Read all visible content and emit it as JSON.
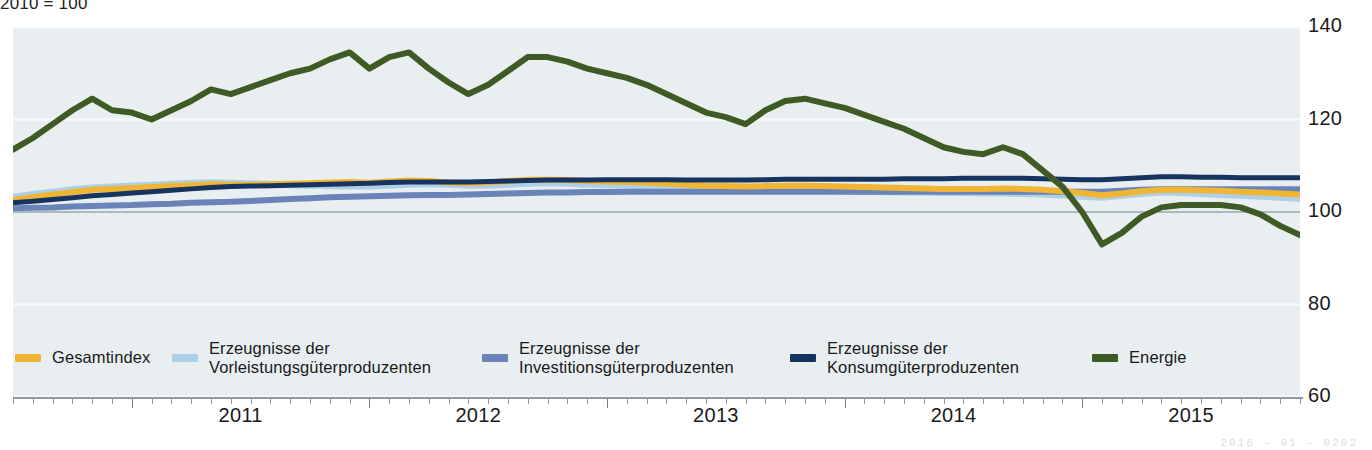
{
  "subtitle": "2010 = 100",
  "footnote": "2016 - 01 - 0202",
  "axes": {
    "y_ticks": [
      140,
      120,
      100,
      80,
      60
    ],
    "ylim": [
      60,
      140
    ],
    "x_year_labels": [
      "2011",
      "2012",
      "2013",
      "2014",
      "2015"
    ],
    "xlim_start": "2010-07",
    "xlim_end": "2015-12"
  },
  "colors": {
    "gesamtindex": "#f0b633",
    "vorleistung": "#aecfe8",
    "investition": "#6a83b8",
    "konsum": "#17335f",
    "energie": "#3f5a24",
    "plot_background": "#e9eef1",
    "gridline": "#f4f7f9",
    "baseline_100": "#9aa6ae",
    "axis": "#8d9aa4"
  },
  "legend": [
    {
      "key": "gesamtindex",
      "label": "Gesamtindex",
      "color": "#f0b633",
      "x": 15
    },
    {
      "key": "vorleistung",
      "label": "Erzeugnisse der\nVorleistungsgüterproduzenten",
      "color": "#aecfe8",
      "x": 172
    },
    {
      "key": "investition",
      "label": "Erzeugnisse der\nInvestitionsgüterproduzenten",
      "color": "#6a83b8",
      "x": 482
    },
    {
      "key": "konsum",
      "label": "Erzeugnisse der\nKonsumgüterproduzenten",
      "color": "#17335f",
      "x": 790
    },
    {
      "key": "energie",
      "label": "Energie",
      "color": "#3f5a24",
      "x": 1092
    }
  ],
  "chart_data": {
    "type": "line",
    "title": "",
    "subtitle": "2010 = 100",
    "xlabel": "",
    "ylabel": "",
    "ylim": [
      60,
      140
    ],
    "grid": true,
    "legend_position": "bottom",
    "x": [
      "2010-07",
      "2010-08",
      "2010-09",
      "2010-10",
      "2010-11",
      "2010-12",
      "2011-01",
      "2011-02",
      "2011-03",
      "2011-04",
      "2011-05",
      "2011-06",
      "2011-07",
      "2011-08",
      "2011-09",
      "2011-10",
      "2011-11",
      "2011-12",
      "2012-01",
      "2012-02",
      "2012-03",
      "2012-04",
      "2012-05",
      "2012-06",
      "2012-07",
      "2012-08",
      "2012-09",
      "2012-10",
      "2012-11",
      "2012-12",
      "2013-01",
      "2013-02",
      "2013-03",
      "2013-04",
      "2013-05",
      "2013-06",
      "2013-07",
      "2013-08",
      "2013-09",
      "2013-10",
      "2013-11",
      "2013-12",
      "2014-01",
      "2014-02",
      "2014-03",
      "2014-04",
      "2014-05",
      "2014-06",
      "2014-07",
      "2014-08",
      "2014-09",
      "2014-10",
      "2014-11",
      "2014-12",
      "2015-01",
      "2015-02",
      "2015-03",
      "2015-04",
      "2015-05",
      "2015-06",
      "2015-07",
      "2015-08",
      "2015-09",
      "2015-10",
      "2015-11",
      "2015-12"
    ],
    "series": [
      {
        "name": "Energie",
        "color": "#3f5a24",
        "values": [
          113.5,
          116.0,
          119.0,
          122.0,
          124.5,
          122.0,
          121.5,
          120.0,
          122.0,
          124.0,
          126.5,
          125.5,
          127.0,
          128.5,
          130.0,
          131.0,
          133.0,
          134.5,
          131.0,
          133.5,
          134.5,
          131.0,
          128.0,
          125.5,
          127.5,
          130.5,
          133.5,
          133.5,
          132.5,
          131.0,
          130.0,
          129.0,
          127.5,
          125.5,
          123.5,
          121.5,
          120.5,
          119.0,
          122.0,
          124.0,
          124.5,
          123.5,
          122.5,
          121.0,
          119.5,
          118.0,
          116.0,
          114.0,
          113.0,
          112.5,
          114.0,
          112.5,
          109.0,
          105.5,
          100.0,
          93.0,
          95.5,
          99.0,
          101.0,
          101.5,
          101.5,
          101.5,
          101.0,
          99.5,
          97.0,
          95.0
        ]
      },
      {
        "name": "Erzeugnisse der Vorleistungsgüterproduzenten",
        "color": "#aecfe8",
        "values": [
          103.2,
          103.8,
          104.3,
          104.8,
          105.2,
          105.4,
          105.6,
          105.8,
          106.0,
          106.2,
          106.3,
          106.2,
          106.1,
          106.0,
          105.9,
          105.8,
          105.7,
          105.6,
          105.6,
          105.8,
          106.0,
          106.1,
          106.0,
          105.8,
          105.8,
          106.0,
          106.2,
          106.3,
          106.2,
          106.0,
          105.9,
          105.8,
          105.7,
          105.5,
          105.3,
          105.1,
          105.0,
          104.9,
          104.9,
          104.9,
          104.8,
          104.7,
          104.6,
          104.5,
          104.4,
          104.3,
          104.3,
          104.2,
          104.2,
          104.1,
          104.1,
          104.0,
          103.9,
          103.7,
          103.4,
          103.2,
          103.6,
          104.0,
          104.3,
          104.2,
          104.0,
          103.8,
          103.6,
          103.4,
          103.2,
          103.0
        ]
      },
      {
        "name": "Gesamtindex",
        "color": "#f0b633",
        "values": [
          102.6,
          103.2,
          103.8,
          104.3,
          104.8,
          105.0,
          105.2,
          105.4,
          105.6,
          105.8,
          106.0,
          105.9,
          105.9,
          106.0,
          106.1,
          106.2,
          106.4,
          106.5,
          106.3,
          106.6,
          106.8,
          106.7,
          106.4,
          106.2,
          106.4,
          106.7,
          107.0,
          107.0,
          106.9,
          106.7,
          106.6,
          106.5,
          106.3,
          106.1,
          105.9,
          105.7,
          105.6,
          105.5,
          105.6,
          105.7,
          105.7,
          105.6,
          105.5,
          105.4,
          105.3,
          105.2,
          105.1,
          105.0,
          105.0,
          105.0,
          105.1,
          105.0,
          104.8,
          104.5,
          104.1,
          103.6,
          104.0,
          104.5,
          104.8,
          104.8,
          104.7,
          104.6,
          104.4,
          104.2,
          104.0,
          103.8
        ]
      },
      {
        "name": "Erzeugnisse der Konsumgüterproduzenten",
        "color": "#17335f",
        "values": [
          102.0,
          102.3,
          102.7,
          103.1,
          103.5,
          103.8,
          104.1,
          104.4,
          104.7,
          105.0,
          105.3,
          105.5,
          105.6,
          105.7,
          105.8,
          105.9,
          106.0,
          106.1,
          106.2,
          106.4,
          106.5,
          106.5,
          106.5,
          106.5,
          106.6,
          106.7,
          106.8,
          106.9,
          106.9,
          106.9,
          107.0,
          107.0,
          107.0,
          107.0,
          106.9,
          106.9,
          106.9,
          106.9,
          107.0,
          107.1,
          107.1,
          107.1,
          107.1,
          107.1,
          107.1,
          107.2,
          107.2,
          107.2,
          107.3,
          107.3,
          107.3,
          107.3,
          107.2,
          107.1,
          107.0,
          107.0,
          107.2,
          107.4,
          107.6,
          107.6,
          107.5,
          107.5,
          107.4,
          107.4,
          107.4,
          107.4
        ]
      },
      {
        "name": "Erzeugnisse der Investitionsgüterproduzenten",
        "color": "#6a83b8",
        "values": [
          100.8,
          100.9,
          101.0,
          101.2,
          101.3,
          101.4,
          101.5,
          101.7,
          101.8,
          102.0,
          102.1,
          102.2,
          102.4,
          102.6,
          102.8,
          103.0,
          103.2,
          103.3,
          103.4,
          103.5,
          103.6,
          103.7,
          103.7,
          103.8,
          103.9,
          104.0,
          104.1,
          104.2,
          104.2,
          104.3,
          104.3,
          104.4,
          104.4,
          104.4,
          104.4,
          104.4,
          104.4,
          104.4,
          104.4,
          104.4,
          104.4,
          104.4,
          104.4,
          104.4,
          104.4,
          104.4,
          104.4,
          104.4,
          104.4,
          104.4,
          104.4,
          104.4,
          104.4,
          104.4,
          104.4,
          104.4,
          104.6,
          104.8,
          104.9,
          104.9,
          104.9,
          104.9,
          104.9,
          104.9,
          104.9,
          104.9
        ]
      }
    ]
  }
}
